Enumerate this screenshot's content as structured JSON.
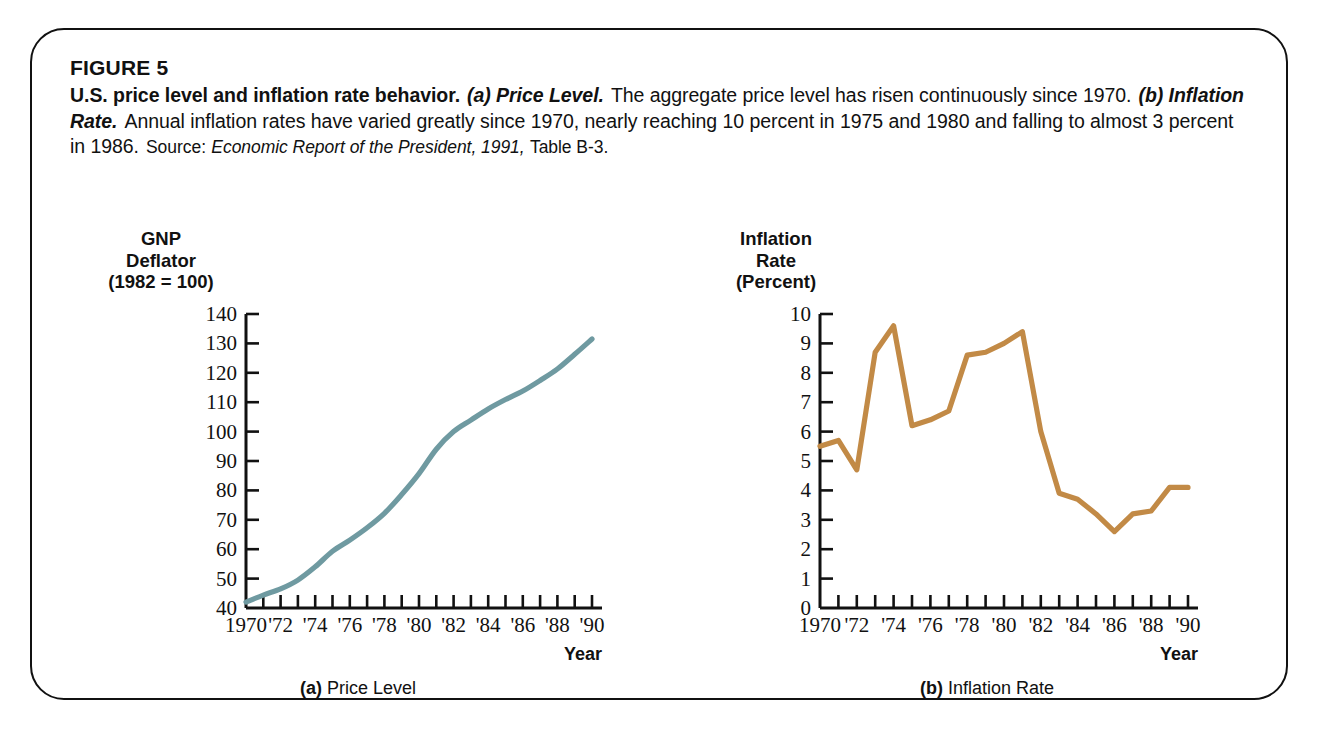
{
  "figure": {
    "number_label": "FIGURE 5",
    "title": "U.S. price level and inflation rate behavior.",
    "part_a_italic": "(a) Price Level.",
    "sentence_a": "The aggregate price level has risen continuously since 1970.",
    "part_b_italic": "(b) Inflation Rate.",
    "sentence_b": "Annual inflation rates have varied greatly since 1970, nearly reaching 10 percent in 1975 and 1980 and falling to almost 3 percent in 1986.",
    "source_label": "Source:",
    "source_italic": "Economic Report of the President, 1991,",
    "source_tail": "Table B-3.",
    "frame_color": "#111111"
  },
  "panel_a": {
    "axis_title_lines": [
      "GNP",
      "Deflator",
      "(1982 = 100)"
    ],
    "subcaption_bold": "(a)",
    "subcaption_text": "Price Level",
    "x_axis_label": "Year",
    "line_color": "#6f9aa1"
  },
  "panel_b": {
    "axis_title_lines": [
      "Inflation",
      "Rate",
      "(Percent)"
    ],
    "subcaption_bold": "(b)",
    "subcaption_text": "Inflation Rate",
    "x_axis_label": "Year",
    "line_color": "#c28a46"
  },
  "chart_data": [
    {
      "type": "line",
      "id": "price-level",
      "title": "(a) Price Level",
      "xlabel": "Year",
      "ylabel": "GNP Deflator (1982 = 100)",
      "xlim": [
        1970,
        1990
      ],
      "ylim": [
        40,
        140
      ],
      "ytick_labels": [
        "40",
        "50",
        "60",
        "70",
        "80",
        "90",
        "100",
        "110",
        "120",
        "130",
        "140"
      ],
      "ytick_values": [
        40,
        50,
        60,
        70,
        80,
        90,
        100,
        110,
        120,
        130,
        140
      ],
      "xtick_labels": [
        "1970",
        "'72",
        "'74",
        "'76",
        "'78",
        "'80",
        "'82",
        "'84",
        "'86",
        "'88",
        "'90"
      ],
      "xtick_values": [
        1970,
        1972,
        1974,
        1976,
        1978,
        1980,
        1982,
        1984,
        1986,
        1988,
        1990
      ],
      "minor_ticks_every": 1,
      "grid": false,
      "legend": null,
      "x": [
        1970,
        1971,
        1972,
        1973,
        1974,
        1975,
        1976,
        1977,
        1978,
        1979,
        1980,
        1981,
        1982,
        1983,
        1984,
        1985,
        1986,
        1987,
        1988,
        1989,
        1990
      ],
      "values": [
        42.0,
        44.4,
        46.5,
        49.5,
        54.0,
        59.3,
        63.1,
        67.3,
        72.2,
        78.6,
        85.7,
        94.0,
        100.0,
        103.9,
        107.7,
        110.9,
        113.8,
        117.4,
        121.3,
        126.3,
        131.5
      ]
    },
    {
      "type": "line",
      "id": "inflation-rate",
      "title": "(b) Inflation Rate",
      "xlabel": "Year",
      "ylabel": "Inflation Rate (Percent)",
      "xlim": [
        1970,
        1990
      ],
      "ylim": [
        0,
        10
      ],
      "ytick_labels": [
        "0",
        "1",
        "2",
        "3",
        "4",
        "5",
        "6",
        "7",
        "8",
        "9",
        "10"
      ],
      "ytick_values": [
        0,
        1,
        2,
        3,
        4,
        5,
        6,
        7,
        8,
        9,
        10
      ],
      "xtick_labels": [
        "1970",
        "'72",
        "'74",
        "'76",
        "'78",
        "'80",
        "'82",
        "'84",
        "'86",
        "'88",
        "'90"
      ],
      "xtick_values": [
        1970,
        1972,
        1974,
        1976,
        1978,
        1980,
        1982,
        1984,
        1986,
        1988,
        1990
      ],
      "minor_ticks_every": 1,
      "grid": false,
      "legend": null,
      "x": [
        1970,
        1971,
        1972,
        1973,
        1974,
        1975,
        1976,
        1977,
        1978,
        1979,
        1980,
        1981,
        1982,
        1983,
        1984,
        1985,
        1986,
        1987,
        1988,
        1989,
        1990
      ],
      "values": [
        5.5,
        5.7,
        4.7,
        8.7,
        9.6,
        6.2,
        6.4,
        6.7,
        8.6,
        8.7,
        9.0,
        9.4,
        6.0,
        3.9,
        3.7,
        3.2,
        2.6,
        3.2,
        3.3,
        4.1,
        4.1
      ]
    }
  ]
}
